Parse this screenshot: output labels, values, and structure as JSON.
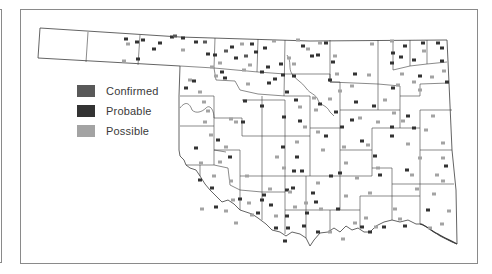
{
  "legend": {
    "items": [
      {
        "label": "Confirmed",
        "color": "#595959"
      },
      {
        "label": "Probable",
        "color": "#333333"
      },
      {
        "label": "Possible",
        "color": "#a3a3a3"
      }
    ]
  },
  "colors": {
    "confirmed": "#595959",
    "probable": "#333333",
    "possible": "#a3a3a3",
    "county_border": "#3c3c3c",
    "frame": "#8a8a8a"
  },
  "markers": [
    {
      "x": 126,
      "y": 39,
      "t": "probable"
    },
    {
      "x": 128,
      "y": 44,
      "t": "possible"
    },
    {
      "x": 137,
      "y": 42,
      "t": "probable"
    },
    {
      "x": 143,
      "y": 40,
      "t": "probable"
    },
    {
      "x": 154,
      "y": 49,
      "t": "probable"
    },
    {
      "x": 160,
      "y": 43,
      "t": "probable"
    },
    {
      "x": 172,
      "y": 37,
      "t": "probable"
    },
    {
      "x": 175,
      "y": 36,
      "t": "confirmed"
    },
    {
      "x": 183,
      "y": 38,
      "t": "probable"
    },
    {
      "x": 183,
      "y": 50,
      "t": "possible"
    },
    {
      "x": 124,
      "y": 61,
      "t": "possible"
    },
    {
      "x": 138,
      "y": 59,
      "t": "probable"
    },
    {
      "x": 196,
      "y": 42,
      "t": "probable"
    },
    {
      "x": 205,
      "y": 42,
      "t": "confirmed"
    },
    {
      "x": 208,
      "y": 54,
      "t": "probable"
    },
    {
      "x": 215,
      "y": 55,
      "t": "probable"
    },
    {
      "x": 220,
      "y": 63,
      "t": "possible"
    },
    {
      "x": 212,
      "y": 67,
      "t": "possible"
    },
    {
      "x": 222,
      "y": 72,
      "t": "probable"
    },
    {
      "x": 216,
      "y": 76,
      "t": "possible"
    },
    {
      "x": 225,
      "y": 78,
      "t": "probable"
    },
    {
      "x": 226,
      "y": 51,
      "t": "confirmed"
    },
    {
      "x": 232,
      "y": 47,
      "t": "probable"
    },
    {
      "x": 236,
      "y": 58,
      "t": "probable"
    },
    {
      "x": 242,
      "y": 44,
      "t": "possible"
    },
    {
      "x": 246,
      "y": 56,
      "t": "confirmed"
    },
    {
      "x": 244,
      "y": 70,
      "t": "possible"
    },
    {
      "x": 252,
      "y": 44,
      "t": "probable"
    },
    {
      "x": 250,
      "y": 65,
      "t": "possible"
    },
    {
      "x": 256,
      "y": 52,
      "t": "probable"
    },
    {
      "x": 265,
      "y": 48,
      "t": "probable"
    },
    {
      "x": 262,
      "y": 72,
      "t": "probable"
    },
    {
      "x": 268,
      "y": 67,
      "t": "probable"
    },
    {
      "x": 274,
      "y": 41,
      "t": "possible"
    },
    {
      "x": 269,
      "y": 83,
      "t": "probable"
    },
    {
      "x": 248,
      "y": 84,
      "t": "possible"
    },
    {
      "x": 186,
      "y": 88,
      "t": "probable"
    },
    {
      "x": 190,
      "y": 80,
      "t": "possible"
    },
    {
      "x": 194,
      "y": 81,
      "t": "probable"
    },
    {
      "x": 200,
      "y": 92,
      "t": "possible"
    },
    {
      "x": 204,
      "y": 102,
      "t": "possible"
    },
    {
      "x": 208,
      "y": 111,
      "t": "possible"
    },
    {
      "x": 205,
      "y": 122,
      "t": "possible"
    },
    {
      "x": 231,
      "y": 119,
      "t": "possible"
    },
    {
      "x": 236,
      "y": 122,
      "t": "possible"
    },
    {
      "x": 243,
      "y": 122,
      "t": "probable"
    },
    {
      "x": 245,
      "y": 101,
      "t": "probable"
    },
    {
      "x": 262,
      "y": 106,
      "t": "probable"
    },
    {
      "x": 275,
      "y": 79,
      "t": "probable"
    },
    {
      "x": 283,
      "y": 75,
      "t": "probable"
    },
    {
      "x": 289,
      "y": 58,
      "t": "possible"
    },
    {
      "x": 281,
      "y": 64,
      "t": "probable"
    },
    {
      "x": 294,
      "y": 64,
      "t": "possible"
    },
    {
      "x": 294,
      "y": 76,
      "t": "probable"
    },
    {
      "x": 303,
      "y": 46,
      "t": "probable"
    },
    {
      "x": 298,
      "y": 40,
      "t": "possible"
    },
    {
      "x": 308,
      "y": 49,
      "t": "possible"
    },
    {
      "x": 312,
      "y": 56,
      "t": "probable"
    },
    {
      "x": 320,
      "y": 43,
      "t": "possible"
    },
    {
      "x": 318,
      "y": 55,
      "t": "probable"
    },
    {
      "x": 326,
      "y": 43,
      "t": "probable"
    },
    {
      "x": 335,
      "y": 56,
      "t": "possible"
    },
    {
      "x": 333,
      "y": 62,
      "t": "probable"
    },
    {
      "x": 337,
      "y": 74,
      "t": "possible"
    },
    {
      "x": 330,
      "y": 80,
      "t": "probable"
    },
    {
      "x": 340,
      "y": 91,
      "t": "possible"
    },
    {
      "x": 352,
      "y": 86,
      "t": "possible"
    },
    {
      "x": 355,
      "y": 74,
      "t": "probable"
    },
    {
      "x": 372,
      "y": 44,
      "t": "possible"
    },
    {
      "x": 369,
      "y": 75,
      "t": "possible"
    },
    {
      "x": 392,
      "y": 41,
      "t": "possible"
    },
    {
      "x": 393,
      "y": 53,
      "t": "probable"
    },
    {
      "x": 392,
      "y": 63,
      "t": "probable"
    },
    {
      "x": 393,
      "y": 88,
      "t": "probable"
    },
    {
      "x": 401,
      "y": 57,
      "t": "probable"
    },
    {
      "x": 405,
      "y": 46,
      "t": "probable"
    },
    {
      "x": 414,
      "y": 60,
      "t": "probable"
    },
    {
      "x": 424,
      "y": 51,
      "t": "possible"
    },
    {
      "x": 423,
      "y": 43,
      "t": "probable"
    },
    {
      "x": 438,
      "y": 43,
      "t": "probable"
    },
    {
      "x": 442,
      "y": 48,
      "t": "probable"
    },
    {
      "x": 442,
      "y": 61,
      "t": "probable"
    },
    {
      "x": 444,
      "y": 71,
      "t": "possible"
    },
    {
      "x": 402,
      "y": 74,
      "t": "possible"
    },
    {
      "x": 398,
      "y": 85,
      "t": "possible"
    },
    {
      "x": 414,
      "y": 82,
      "t": "possible"
    },
    {
      "x": 420,
      "y": 76,
      "t": "probable"
    },
    {
      "x": 420,
      "y": 90,
      "t": "possible"
    },
    {
      "x": 432,
      "y": 77,
      "t": "possible"
    },
    {
      "x": 447,
      "y": 82,
      "t": "probable"
    },
    {
      "x": 287,
      "y": 92,
      "t": "probable"
    },
    {
      "x": 296,
      "y": 100,
      "t": "probable"
    },
    {
      "x": 300,
      "y": 107,
      "t": "possible"
    },
    {
      "x": 284,
      "y": 117,
      "t": "probable"
    },
    {
      "x": 300,
      "y": 121,
      "t": "probable"
    },
    {
      "x": 305,
      "y": 127,
      "t": "possible"
    },
    {
      "x": 314,
      "y": 98,
      "t": "possible"
    },
    {
      "x": 316,
      "y": 110,
      "t": "possible"
    },
    {
      "x": 320,
      "y": 104,
      "t": "probable"
    },
    {
      "x": 330,
      "y": 99,
      "t": "possible"
    },
    {
      "x": 336,
      "y": 112,
      "t": "probable"
    },
    {
      "x": 342,
      "y": 127,
      "t": "probable"
    },
    {
      "x": 352,
      "y": 120,
      "t": "probable"
    },
    {
      "x": 356,
      "y": 102,
      "t": "probable"
    },
    {
      "x": 360,
      "y": 118,
      "t": "possible"
    },
    {
      "x": 374,
      "y": 106,
      "t": "probable"
    },
    {
      "x": 378,
      "y": 122,
      "t": "possible"
    },
    {
      "x": 385,
      "y": 100,
      "t": "possible"
    },
    {
      "x": 392,
      "y": 127,
      "t": "probable"
    },
    {
      "x": 394,
      "y": 113,
      "t": "possible"
    },
    {
      "x": 403,
      "y": 121,
      "t": "possible"
    },
    {
      "x": 408,
      "y": 116,
      "t": "probable"
    },
    {
      "x": 414,
      "y": 128,
      "t": "probable"
    },
    {
      "x": 426,
      "y": 130,
      "t": "possible"
    },
    {
      "x": 433,
      "y": 116,
      "t": "possible"
    },
    {
      "x": 443,
      "y": 143,
      "t": "possible"
    },
    {
      "x": 443,
      "y": 158,
      "t": "possible"
    },
    {
      "x": 211,
      "y": 135,
      "t": "possible"
    },
    {
      "x": 218,
      "y": 140,
      "t": "probable"
    },
    {
      "x": 196,
      "y": 148,
      "t": "probable"
    },
    {
      "x": 201,
      "y": 163,
      "t": "possible"
    },
    {
      "x": 220,
      "y": 162,
      "t": "possible"
    },
    {
      "x": 230,
      "y": 157,
      "t": "probable"
    },
    {
      "x": 226,
      "y": 147,
      "t": "possible"
    },
    {
      "x": 247,
      "y": 176,
      "t": "possible"
    },
    {
      "x": 264,
      "y": 195,
      "t": "probable"
    },
    {
      "x": 270,
      "y": 189,
      "t": "possible"
    },
    {
      "x": 277,
      "y": 157,
      "t": "possible"
    },
    {
      "x": 283,
      "y": 147,
      "t": "probable"
    },
    {
      "x": 284,
      "y": 168,
      "t": "possible"
    },
    {
      "x": 294,
      "y": 171,
      "t": "probable"
    },
    {
      "x": 297,
      "y": 157,
      "t": "probable"
    },
    {
      "x": 297,
      "y": 142,
      "t": "possible"
    },
    {
      "x": 302,
      "y": 171,
      "t": "probable"
    },
    {
      "x": 318,
      "y": 132,
      "t": "possible"
    },
    {
      "x": 326,
      "y": 136,
      "t": "probable"
    },
    {
      "x": 323,
      "y": 150,
      "t": "possible"
    },
    {
      "x": 331,
      "y": 176,
      "t": "probable"
    },
    {
      "x": 340,
      "y": 173,
      "t": "probable"
    },
    {
      "x": 344,
      "y": 147,
      "t": "possible"
    },
    {
      "x": 346,
      "y": 163,
      "t": "possible"
    },
    {
      "x": 357,
      "y": 178,
      "t": "possible"
    },
    {
      "x": 362,
      "y": 141,
      "t": "probable"
    },
    {
      "x": 368,
      "y": 145,
      "t": "possible"
    },
    {
      "x": 375,
      "y": 156,
      "t": "probable"
    },
    {
      "x": 378,
      "y": 168,
      "t": "possible"
    },
    {
      "x": 380,
      "y": 175,
      "t": "probable"
    },
    {
      "x": 392,
      "y": 136,
      "t": "probable"
    },
    {
      "x": 408,
      "y": 144,
      "t": "possible"
    },
    {
      "x": 407,
      "y": 170,
      "t": "probable"
    },
    {
      "x": 412,
      "y": 175,
      "t": "possible"
    },
    {
      "x": 420,
      "y": 158,
      "t": "possible"
    },
    {
      "x": 437,
      "y": 175,
      "t": "possible"
    },
    {
      "x": 443,
      "y": 181,
      "t": "possible"
    },
    {
      "x": 446,
      "y": 166,
      "t": "probable"
    },
    {
      "x": 417,
      "y": 189,
      "t": "possible"
    },
    {
      "x": 434,
      "y": 194,
      "t": "possible"
    },
    {
      "x": 449,
      "y": 211,
      "t": "possible"
    },
    {
      "x": 428,
      "y": 210,
      "t": "probable"
    },
    {
      "x": 442,
      "y": 224,
      "t": "possible"
    },
    {
      "x": 430,
      "y": 228,
      "t": "possible"
    },
    {
      "x": 200,
      "y": 180,
      "t": "probable"
    },
    {
      "x": 212,
      "y": 188,
      "t": "probable"
    },
    {
      "x": 214,
      "y": 176,
      "t": "possible"
    },
    {
      "x": 231,
      "y": 181,
      "t": "possible"
    },
    {
      "x": 240,
      "y": 199,
      "t": "probable"
    },
    {
      "x": 249,
      "y": 203,
      "t": "possible"
    },
    {
      "x": 258,
      "y": 213,
      "t": "probable"
    },
    {
      "x": 233,
      "y": 200,
      "t": "possible"
    },
    {
      "x": 262,
      "y": 200,
      "t": "probable"
    },
    {
      "x": 271,
      "y": 205,
      "t": "probable"
    },
    {
      "x": 276,
      "y": 216,
      "t": "possible"
    },
    {
      "x": 276,
      "y": 228,
      "t": "probable"
    },
    {
      "x": 287,
      "y": 216,
      "t": "probable"
    },
    {
      "x": 287,
      "y": 190,
      "t": "probable"
    },
    {
      "x": 290,
      "y": 192,
      "t": "possible"
    },
    {
      "x": 293,
      "y": 188,
      "t": "probable"
    },
    {
      "x": 295,
      "y": 207,
      "t": "possible"
    },
    {
      "x": 288,
      "y": 228,
      "t": "probable"
    },
    {
      "x": 306,
      "y": 203,
      "t": "possible"
    },
    {
      "x": 307,
      "y": 213,
      "t": "probable"
    },
    {
      "x": 313,
      "y": 193,
      "t": "probable"
    },
    {
      "x": 318,
      "y": 183,
      "t": "possible"
    },
    {
      "x": 316,
      "y": 202,
      "t": "probable"
    },
    {
      "x": 318,
      "y": 232,
      "t": "probable"
    },
    {
      "x": 321,
      "y": 209,
      "t": "possible"
    },
    {
      "x": 304,
      "y": 226,
      "t": "probable"
    },
    {
      "x": 330,
      "y": 232,
      "t": "possible"
    },
    {
      "x": 338,
      "y": 209,
      "t": "probable"
    },
    {
      "x": 343,
      "y": 239,
      "t": "possible"
    },
    {
      "x": 355,
      "y": 223,
      "t": "possible"
    },
    {
      "x": 362,
      "y": 227,
      "t": "probable"
    },
    {
      "x": 366,
      "y": 218,
      "t": "possible"
    },
    {
      "x": 370,
      "y": 232,
      "t": "probable"
    },
    {
      "x": 376,
      "y": 227,
      "t": "possible"
    },
    {
      "x": 384,
      "y": 227,
      "t": "probable"
    },
    {
      "x": 400,
      "y": 219,
      "t": "possible"
    },
    {
      "x": 405,
      "y": 226,
      "t": "probable"
    },
    {
      "x": 252,
      "y": 215,
      "t": "possible"
    },
    {
      "x": 202,
      "y": 209,
      "t": "possible"
    },
    {
      "x": 236,
      "y": 223,
      "t": "possible"
    },
    {
      "x": 226,
      "y": 211,
      "t": "possible"
    },
    {
      "x": 216,
      "y": 207,
      "t": "probable"
    },
    {
      "x": 285,
      "y": 241,
      "t": "probable"
    },
    {
      "x": 346,
      "y": 196,
      "t": "possible"
    },
    {
      "x": 370,
      "y": 193,
      "t": "possible"
    },
    {
      "x": 395,
      "y": 209,
      "t": "possible"
    }
  ]
}
